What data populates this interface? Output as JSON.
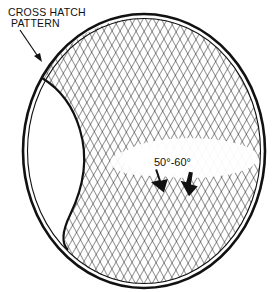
{
  "diagram": {
    "callout": {
      "line1": "CROSS HATCH",
      "line2": "PATTERN"
    },
    "angle_label": "50°-60°",
    "colors": {
      "ink": "#111111",
      "background": "#ffffff"
    },
    "elements": [
      {
        "name": "cylinder-bore-outline",
        "shape": "ellipse"
      },
      {
        "name": "cross-hatch-pattern",
        "shape": "hatched region"
      },
      {
        "name": "unhatched-crescent",
        "shape": "lens, left side"
      },
      {
        "name": "leader-arrow",
        "points_to": "bore wall"
      },
      {
        "name": "direction-arrows",
        "count": 2
      }
    ]
  }
}
